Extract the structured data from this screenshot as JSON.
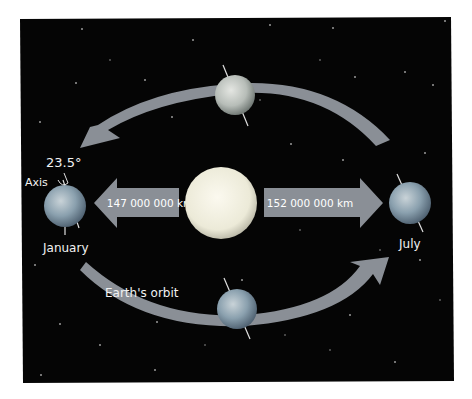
{
  "diagram": {
    "labels": {
      "angle": "23.5°",
      "axis": "Axis",
      "january": "January",
      "july": "July",
      "orbit": "Earth's orbit",
      "perihelion_distance": "147 000 000 km",
      "aphelion_distance": "152 000 000 km"
    },
    "colors": {
      "space": "#050505",
      "arrow": "#8a8f96",
      "sun": "#f4f1e4",
      "earth": "#7f97a8",
      "label": "#f2f2f2"
    },
    "elements": {
      "sun": "sun-icon",
      "earths": [
        "earth-january",
        "earth-top",
        "earth-july",
        "earth-bottom"
      ]
    }
  }
}
